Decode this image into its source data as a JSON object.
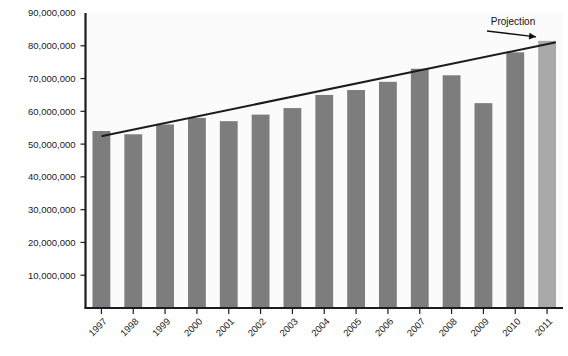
{
  "chart_data": {
    "type": "bar",
    "title": "",
    "subtitle": "",
    "xlabel": "",
    "ylabel": "",
    "categories": [
      "1997",
      "1998",
      "1999",
      "2000",
      "2001",
      "2002",
      "2003",
      "2004",
      "2005",
      "2006",
      "2007",
      "2008",
      "2009",
      "2010",
      "2011"
    ],
    "values": [
      54000000,
      53000000,
      56000000,
      58000000,
      57000000,
      59000000,
      61000000,
      65000000,
      66500000,
      69000000,
      73000000,
      71000000,
      62500000,
      78000000,
      81500000
    ],
    "ylim": [
      0,
      90000000
    ],
    "ytick_values": [
      10000000,
      20000000,
      30000000,
      40000000,
      50000000,
      60000000,
      70000000,
      80000000,
      90000000
    ],
    "ytick_labels": [
      "10,000,000",
      "20,000,000",
      "30,000,000",
      "40,000,000",
      "50,000,000",
      "60,000,000",
      "70,000,000",
      "80,000,000",
      "90,000,000"
    ],
    "grid": false,
    "legend": null,
    "bar_color": "#7d7d7d",
    "projection_bar_color": "#a9a9a9",
    "projection_category": "2011",
    "trendline": {
      "color": "#1c1c1c",
      "start": {
        "x": "1997",
        "y": 52500000
      },
      "end": {
        "x": "2011",
        "y": 81000000
      }
    },
    "annotations": [
      {
        "text": "Projection",
        "target_category": "2011",
        "color": "#111111"
      }
    ]
  },
  "axes": {
    "axis_color": "#1c1c1c",
    "tick_color": "#1c1c1c"
  }
}
